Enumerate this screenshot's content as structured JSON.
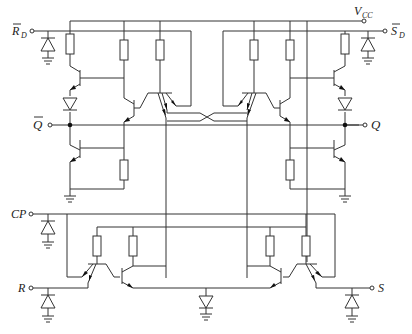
{
  "diagram": {
    "type": "circuit-schematic",
    "labels": {
      "rd": "R",
      "rd_sub": "D",
      "vcc": "V",
      "vcc_sub": "CC",
      "sd": "S",
      "sd_sub": "D",
      "qbar": "Q",
      "q": "Q",
      "cp": "CP",
      "r": "R",
      "s": "S"
    },
    "terminals": [
      {
        "id": "RD_bar",
        "label": "R̄D",
        "side": "left"
      },
      {
        "id": "VCC",
        "label": "VCC",
        "side": "top-right"
      },
      {
        "id": "SD_bar",
        "label": "S̄D",
        "side": "right"
      },
      {
        "id": "Q_bar",
        "label": "Q̄",
        "side": "left"
      },
      {
        "id": "Q",
        "label": "Q",
        "side": "right"
      },
      {
        "id": "CP",
        "label": "CP",
        "side": "left"
      },
      {
        "id": "R",
        "label": "R",
        "side": "left"
      },
      {
        "id": "S",
        "label": "S",
        "side": "right"
      }
    ],
    "components": {
      "resistors": 12,
      "npn_transistors": 8,
      "multi_emitter_transistors": 4,
      "diodes": 7,
      "grounds": 11
    }
  }
}
